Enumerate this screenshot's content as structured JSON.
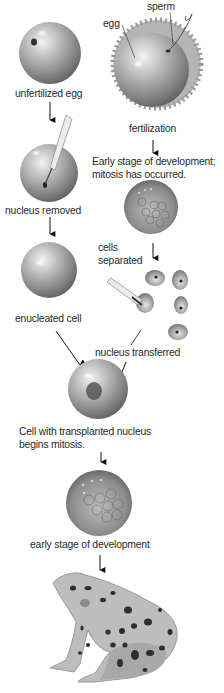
{
  "diagram": {
    "labels": {
      "sperm": "sperm",
      "egg": "egg",
      "unfertilized_egg": "unfertilized egg",
      "fertilization": "fertilization",
      "early_stage_mitosis_line1": "Early stage of development;",
      "early_stage_mitosis_line2": "mitosis has occurred.",
      "nucleus_removed": "nucleus removed",
      "cells_separated_line1": "cells",
      "cells_separated_line2": "separated",
      "enucleated_cell": "enucleated cell",
      "nucleus_transferred": "nucleus transferred",
      "transplanted_line1": "Cell with transplanted nucleus",
      "transplanted_line2": "begins mitosis.",
      "early_stage": "early stage of development"
    },
    "nodes": [
      {
        "id": "unfertilized-egg",
        "label": "unfertilized egg"
      },
      {
        "id": "fertilized-egg",
        "label": "fertilization"
      },
      {
        "id": "nucleus-removed",
        "label": "nucleus removed"
      },
      {
        "id": "early-embryo-donor",
        "label": "Early stage of development; mitosis has occurred."
      },
      {
        "id": "enucleated-cell",
        "label": "enucleated cell"
      },
      {
        "id": "separated-cells",
        "label": "cells separated"
      },
      {
        "id": "transplanted-cell",
        "label": "Cell with transplanted nucleus begins mitosis."
      },
      {
        "id": "early-embryo",
        "label": "early stage of development"
      },
      {
        "id": "adult-frog",
        "label": ""
      }
    ],
    "edges": [
      {
        "from": "unfertilized-egg",
        "to": "nucleus-removed"
      },
      {
        "from": "nucleus-removed",
        "to": "enucleated-cell"
      },
      {
        "from": "fertilized-egg",
        "to": "early-embryo-donor"
      },
      {
        "from": "early-embryo-donor",
        "to": "separated-cells"
      },
      {
        "from": "enucleated-cell",
        "to": "transplanted-cell"
      },
      {
        "from": "separated-cells",
        "to": "transplanted-cell",
        "label": "nucleus transferred"
      },
      {
        "from": "transplanted-cell",
        "to": "early-embryo"
      },
      {
        "from": "early-embryo",
        "to": "adult-frog"
      }
    ],
    "colors": {
      "text": "#2a2a2a",
      "cell_dark": "#6e6e6e",
      "cell_light": "#e8e8e8",
      "arrow": "#111111"
    }
  }
}
